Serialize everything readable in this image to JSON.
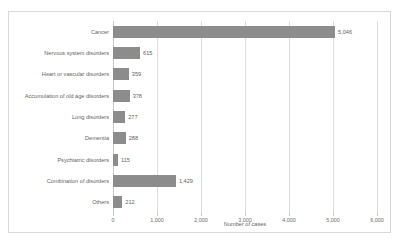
{
  "page": {
    "clipped_header_text": " "
  },
  "chart_data": {
    "type": "bar",
    "orientation": "horizontal",
    "title": "",
    "subtitle": "",
    "xlabel": "Number of cases",
    "ylabel": "",
    "xlim": [
      0,
      6000
    ],
    "xticks": [
      0,
      1000,
      2000,
      3000,
      4000,
      5000,
      6000
    ],
    "xtick_labels": [
      "0",
      "1,000",
      "2,000",
      "3,000",
      "4,000",
      "5,000",
      "6,000"
    ],
    "grid": "vertical",
    "legend": "none",
    "bar_color": "#8c8c8c",
    "categories": [
      "Cancer",
      "Nervous system disorders",
      "Heart or vascular disorders",
      "Accumulation of old age disorders",
      "Long disorders",
      "Dementia",
      "Psychiatric disorders",
      "Combination of disorders",
      "Others"
    ],
    "values": [
      5046,
      615,
      359,
      378,
      277,
      288,
      115,
      1429,
      212
    ],
    "value_labels": [
      "5,046",
      "615",
      "359",
      "378",
      "277",
      "288",
      "115",
      "1,429",
      "212"
    ]
  }
}
